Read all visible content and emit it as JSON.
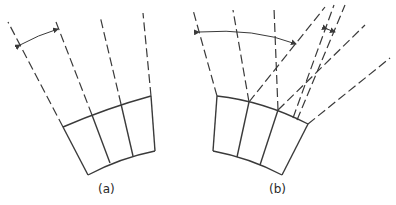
{
  "figure": {
    "panels": [
      {
        "id": "a",
        "label": "(a)",
        "description": "Curved segment block with three cells; dashed radial lines extend outward; angle arrow between first two radials"
      },
      {
        "id": "b",
        "label": "(b)",
        "description": "Curved segment block with three cells; dashed lines diverge at varying angles; wide angle arrow and small angle arrow"
      }
    ]
  }
}
